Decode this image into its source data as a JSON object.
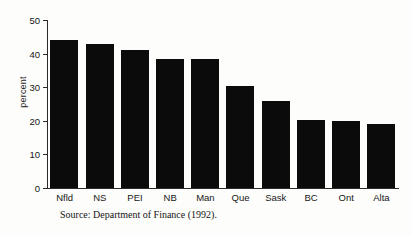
{
  "chart_data": {
    "type": "bar",
    "title": "",
    "xlabel": "",
    "ylabel": "percent",
    "categories": [
      "Nfld",
      "NS",
      "PEI",
      "NB",
      "Man",
      "Que",
      "Sask",
      "BC",
      "Ont",
      "Alta"
    ],
    "values": [
      44,
      43,
      41,
      38.5,
      38.5,
      30.5,
      26,
      20.2,
      20,
      19
    ],
    "ylim": [
      0,
      50
    ],
    "yticks": [
      0,
      10,
      20,
      30,
      40,
      50
    ],
    "ytick_labels": [
      "0",
      "10",
      "20",
      "30",
      "40",
      "50"
    ],
    "grid": false,
    "legend": "none",
    "bar_color": "#0b0b0b",
    "axis_color": "#2b2b2b"
  },
  "figure": {
    "source_note": "Source: Department of Finance (1992)."
  }
}
